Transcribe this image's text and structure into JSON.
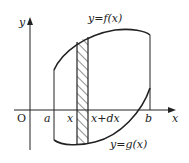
{
  "diagram": {
    "labels": {
      "y_axis": "y",
      "x_axis": "x",
      "origin": "O",
      "a": "a",
      "x": "x",
      "x_plus_dx": "x+dx",
      "b": "b",
      "f_curve": "y=f(x)",
      "g_curve": "y=g(x)"
    },
    "colors": {
      "stroke": "#222222",
      "background": "#ffffff"
    }
  }
}
